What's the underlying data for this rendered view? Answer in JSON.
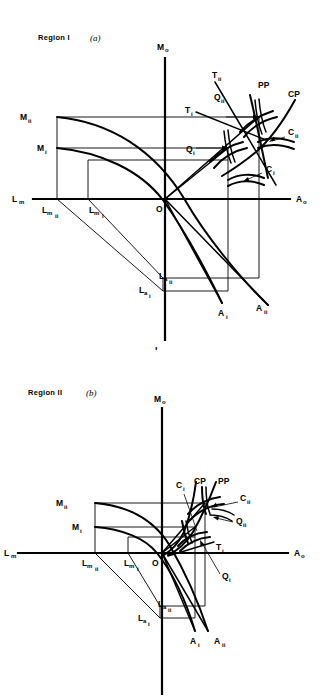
{
  "document": {
    "type": "economic-diagram-pair",
    "background_color": "#ffffff",
    "line_color": "#000000"
  },
  "figures": [
    {
      "id": "figure-a",
      "title_prefix": "Region I",
      "title_suffix": "(a)",
      "axes": {
        "vertical_top": "M",
        "vertical_top_sub": "o",
        "vertical_bottom": "L",
        "vertical_bottom_sub": "a",
        "horizontal_left": "L",
        "horizontal_left_sub": "m",
        "horizontal_right": "A",
        "horizontal_right_sub": "o",
        "origin": "O"
      },
      "labels": [
        {
          "name": "M-ii",
          "base": "M",
          "sub": "ii",
          "x": 20,
          "y": 120
        },
        {
          "name": "M-i",
          "base": "M",
          "sub": "i",
          "x": 37,
          "y": 151
        },
        {
          "name": "Lm-ii",
          "base": "L",
          "sub": "m",
          "sub2": "ii",
          "x": 42,
          "y": 213
        },
        {
          "name": "Lm-i",
          "base": "L",
          "sub": "m",
          "sub2": "i",
          "x": 89,
          "y": 213
        },
        {
          "name": "La-ii",
          "base": "L",
          "sub": "a",
          "sub2": "ii",
          "x": 159,
          "y": 279
        },
        {
          "name": "La-i",
          "base": "L",
          "sub": "a",
          "sub2": "i",
          "x": 139,
          "y": 293
        },
        {
          "name": "A-i",
          "base": "A",
          "sub": "i",
          "x": 218,
          "y": 316
        },
        {
          "name": "A-ii",
          "base": "A",
          "sub": "ii",
          "x": 256,
          "y": 311
        },
        {
          "name": "T-i",
          "base": "T",
          "sub": "i",
          "x": 185,
          "y": 113
        },
        {
          "name": "T-ii",
          "base": "T",
          "sub": "ii",
          "x": 215,
          "y": 78
        },
        {
          "name": "Q-i",
          "base": "Q",
          "sub": "i",
          "x": 188,
          "y": 152
        },
        {
          "name": "Q-ii",
          "base": "Q",
          "sub": "ii",
          "x": 215,
          "y": 100
        },
        {
          "name": "C-i",
          "base": "C",
          "sub": "i",
          "x": 264,
          "y": 170
        },
        {
          "name": "C-ii",
          "base": "C",
          "sub": "ii",
          "x": 287,
          "y": 134
        },
        {
          "name": "PP",
          "base": "PP",
          "sub": "",
          "x": 260,
          "y": 88
        },
        {
          "name": "CP",
          "base": "CP",
          "sub": "",
          "x": 290,
          "y": 97
        }
      ]
    },
    {
      "id": "figure-b",
      "title_prefix": "Region II",
      "title_suffix": "(b)",
      "axes": {
        "vertical_top": "M",
        "vertical_top_sub": "o",
        "vertical_bottom": "",
        "vertical_bottom_sub": "",
        "horizontal_left": "L",
        "horizontal_left_sub": "m",
        "horizontal_right": "A",
        "horizontal_right_sub": "o",
        "origin": "O"
      },
      "labels": [
        {
          "name": "M-ii",
          "base": "M",
          "sub": "ii",
          "x": 56,
          "y": 160
        },
        {
          "name": "M-i",
          "base": "M",
          "sub": "i",
          "x": 72,
          "y": 184
        },
        {
          "name": "Lm-ii",
          "base": "L",
          "sub": "m",
          "sub2": "ii",
          "x": 82,
          "y": 220
        },
        {
          "name": "Lm-i",
          "base": "L",
          "sub": "m",
          "sub2": "i",
          "x": 128,
          "y": 220
        },
        {
          "name": "La-ii",
          "base": "L",
          "sub": "a",
          "sub2": "ii",
          "x": 160,
          "y": 263
        },
        {
          "name": "La-i",
          "base": "L",
          "sub": "a",
          "sub2": "i",
          "x": 138,
          "y": 275
        },
        {
          "name": "A-i",
          "base": "A",
          "sub": "i",
          "x": 192,
          "y": 298
        },
        {
          "name": "A-ii",
          "base": "A",
          "sub": "ii",
          "x": 216,
          "y": 298
        },
        {
          "name": "T-i",
          "base": "T",
          "sub": "i",
          "x": 212,
          "y": 204
        },
        {
          "name": "Q-i",
          "base": "Q",
          "sub": "i",
          "x": 222,
          "y": 232
        },
        {
          "name": "Q-ii",
          "base": "Q",
          "sub": "ii",
          "x": 235,
          "y": 175
        },
        {
          "name": "C-i",
          "base": "C",
          "sub": "i",
          "x": 178,
          "y": 141
        },
        {
          "name": "C-ii",
          "base": "C",
          "sub": "ii",
          "x": 240,
          "y": 155
        },
        {
          "name": "PP",
          "base": "PP",
          "sub": "",
          "x": 222,
          "y": 138
        },
        {
          "name": "CP",
          "base": "CP",
          "sub": "",
          "x": 198,
          "y": 138
        }
      ]
    }
  ]
}
